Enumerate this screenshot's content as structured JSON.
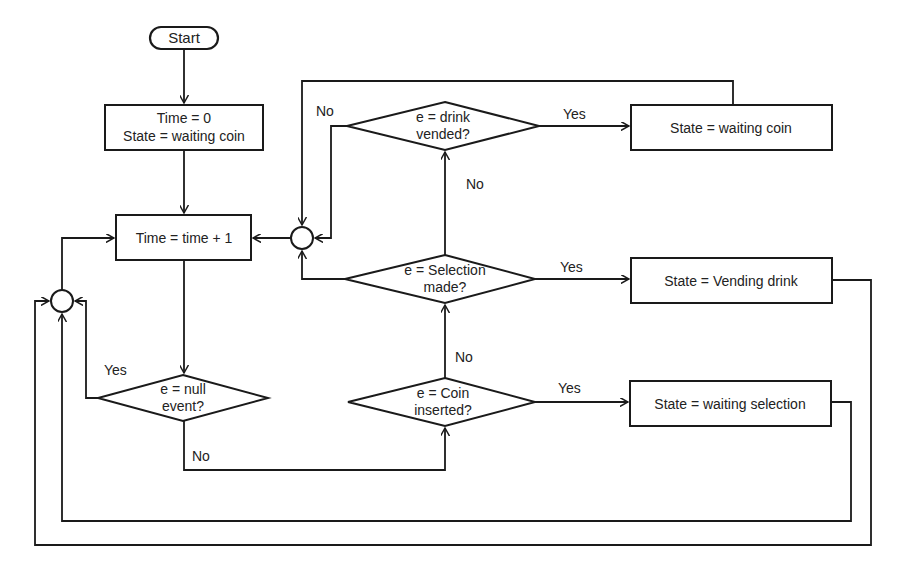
{
  "diagram": {
    "nodes": {
      "start": {
        "label": "Start"
      },
      "init": {
        "line1": "Time = 0",
        "line2": "State = waiting coin"
      },
      "tick": {
        "label": "Time = time + 1"
      },
      "null_event": {
        "line1": "e = null",
        "line2": "event?"
      },
      "coin_inserted": {
        "line1": "e = Coin",
        "line2": "inserted?"
      },
      "selection_made": {
        "line1": "e = Selection",
        "line2": "made?"
      },
      "drink_vended": {
        "line1": "e = drink",
        "line2": "vended?"
      },
      "state_waiting_coin": {
        "label": "State = waiting coin"
      },
      "state_vending_drink": {
        "label": "State = Vending drink"
      },
      "state_waiting_selection": {
        "label": "State = waiting selection"
      }
    },
    "edge_labels": {
      "null_yes": "Yes",
      "null_no": "No",
      "coin_yes": "Yes",
      "coin_no": "No",
      "selection_yes": "Yes",
      "selection_no": "No",
      "drink_yes": "Yes",
      "drink_no": "No"
    },
    "colors": {
      "stroke": "#1a1a1a",
      "background": "#ffffff"
    }
  }
}
